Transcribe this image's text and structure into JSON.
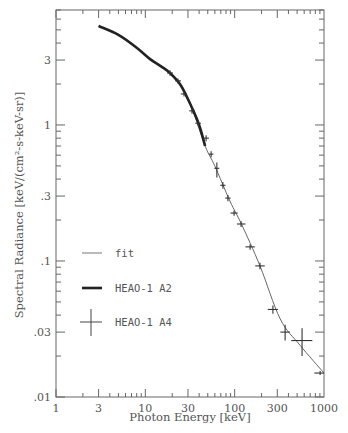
{
  "chart_data": {
    "type": "line",
    "title": "",
    "xlabel": "Photon Energy [keV]",
    "ylabel": "Spectral Radiance [keV/(cm²-s-keV-sr)]",
    "xscale": "log",
    "yscale": "log",
    "xlim": [
      1,
      1000
    ],
    "ylim": [
      0.01,
      7
    ],
    "grid": false,
    "legend_position": "lower left (inside)",
    "x_ticks": [
      1,
      3,
      10,
      30,
      100,
      300,
      1000
    ],
    "x_tick_labels": [
      "1",
      "3",
      "10",
      "30",
      "100",
      "300",
      "1000"
    ],
    "y_ticks": [
      0.01,
      0.03,
      0.1,
      0.3,
      1,
      3
    ],
    "y_tick_labels": [
      ".01",
      ".03",
      ".1",
      ".3",
      "1",
      "3"
    ],
    "legend": [
      {
        "label": "fit",
        "style": "thin-line"
      },
      {
        "label": "HEAO-1 A2",
        "style": "thick-line"
      },
      {
        "label": "HEAO-1 A4",
        "style": "cross-errorbar"
      }
    ],
    "series": [
      {
        "name": "fit",
        "style": "thin-line",
        "x": [
          3.0,
          5,
          8,
          11.3,
          15,
          18.9,
          25,
          33,
          46.7,
          60,
          88.5,
          120,
          192,
          323,
          540,
          1000
        ],
        "y": [
          5.34,
          4.6,
          3.7,
          3.05,
          2.7,
          2.41,
          1.95,
          1.35,
          0.7,
          0.5,
          0.276,
          0.185,
          0.092,
          0.0375,
          0.024,
          0.015
        ]
      },
      {
        "name": "HEAO-1 A2",
        "style": "thick-line",
        "x": [
          3.0,
          5,
          8,
          11.3,
          15,
          18.9,
          25,
          33,
          40,
          46.7
        ],
        "y": [
          5.34,
          4.6,
          3.7,
          3.05,
          2.7,
          2.41,
          1.95,
          1.35,
          1.0,
          0.7
        ]
      },
      {
        "name": "HEAO-1 A4",
        "style": "cross-errorbar",
        "points": [
          {
            "x": 18.9,
            "y": 2.41,
            "xerr": [
              17.5,
              20.4
            ],
            "yerr": [
              2.3,
              2.52
            ]
          },
          {
            "x": 23.2,
            "y": 2.11,
            "xerr": [
              21.5,
              25.0
            ],
            "yerr": [
              2.02,
              2.2
            ]
          },
          {
            "x": 27.1,
            "y": 1.69,
            "xerr": [
              25.0,
              29.3
            ],
            "yerr": [
              1.62,
              1.76
            ]
          },
          {
            "x": 33.3,
            "y": 1.27,
            "xerr": [
              31.0,
              35.8
            ],
            "yerr": [
              1.21,
              1.33
            ]
          },
          {
            "x": 39.0,
            "y": 1.03,
            "xerr": [
              36.3,
              41.9
            ],
            "yerr": [
              0.98,
              1.08
            ]
          },
          {
            "x": 47.9,
            "y": 0.8,
            "xerr": [
              44.6,
              51.5
            ],
            "yerr": [
              0.76,
              0.84
            ]
          },
          {
            "x": 54.5,
            "y": 0.61,
            "xerr": [
              51.5,
              57.7
            ],
            "yerr": [
              0.58,
              0.64
            ]
          },
          {
            "x": 63.2,
            "y": 0.48,
            "xerr": [
              59.3,
              67.3
            ],
            "yerr": [
              0.41,
              0.53
            ]
          },
          {
            "x": 73.8,
            "y": 0.36,
            "xerr": [
              69.0,
              79.0
            ],
            "yerr": [
              0.34,
              0.38
            ]
          },
          {
            "x": 84.1,
            "y": 0.29,
            "xerr": [
              78.5,
              90.0
            ],
            "yerr": [
              0.275,
              0.305
            ]
          },
          {
            "x": 98.5,
            "y": 0.225,
            "xerr": [
              90.0,
              108.0
            ],
            "yerr": [
              0.215,
              0.235
            ]
          },
          {
            "x": 118,
            "y": 0.187,
            "xerr": [
              106,
              132
            ],
            "yerr": [
              0.178,
              0.196
            ]
          },
          {
            "x": 149,
            "y": 0.127,
            "xerr": [
              132,
              168
            ],
            "yerr": [
              0.121,
              0.133
            ]
          },
          {
            "x": 192,
            "y": 0.092,
            "xerr": [
              170,
              217
            ],
            "yerr": [
              0.087,
              0.097
            ]
          },
          {
            "x": 268,
            "y": 0.044,
            "xerr": [
              235,
              305
            ],
            "yerr": [
              0.041,
              0.047
            ]
          },
          {
            "x": 367,
            "y": 0.03,
            "xerr": [
              325,
              415
            ],
            "yerr": [
              0.026,
              0.034
            ]
          },
          {
            "x": 568,
            "y": 0.026,
            "xerr": [
              430,
              740
            ],
            "yerr": [
              0.02,
              0.032
            ]
          },
          {
            "x": 905,
            "y": 0.015,
            "xerr": [
              780,
              1000
            ],
            "yerr": [
              0.0145,
              0.0155
            ]
          }
        ]
      }
    ]
  },
  "plot_area": {
    "left": 56,
    "right": 324,
    "top": 10,
    "bottom": 397
  }
}
